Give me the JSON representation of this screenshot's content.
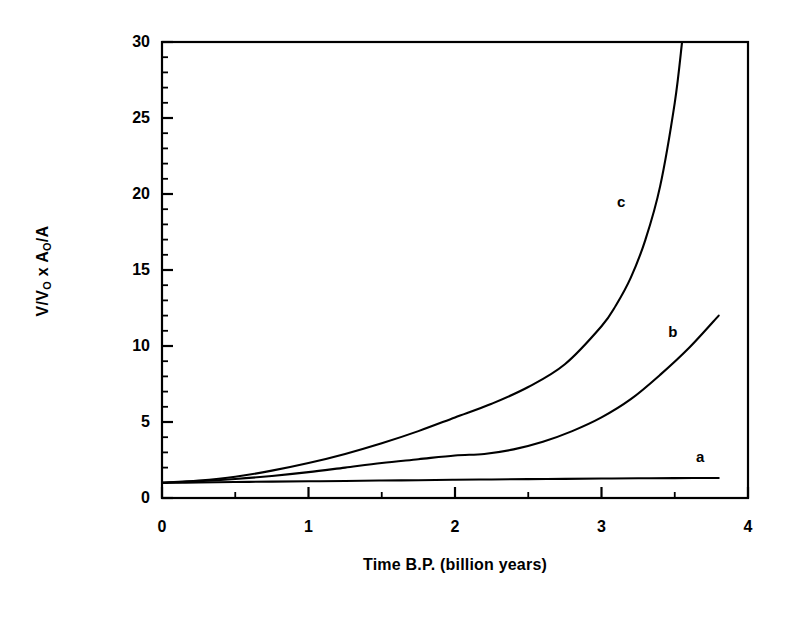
{
  "chart_data": {
    "type": "line",
    "title": "",
    "subtitle": "",
    "xlabel": "Time B.P. (billion years)",
    "ylabel": "V/V₀ x A₀/A",
    "ylabel_parts": {
      "pre1": "V/V",
      "sub1": "O",
      "mid": " x A",
      "sub2": "O",
      "post": "/A"
    },
    "xlim": [
      0,
      4
    ],
    "ylim": [
      0,
      30
    ],
    "xticks": [
      0,
      1,
      2,
      3,
      4
    ],
    "xtick_labels": [
      "0",
      "1",
      "2",
      "3",
      "4"
    ],
    "yticks": [
      0,
      5,
      10,
      15,
      20,
      25,
      30
    ],
    "ytick_labels": [
      "0",
      "5",
      "10",
      "15",
      "20",
      "25",
      "30"
    ],
    "x_minor_step": 0.5,
    "y_minor_step": 1,
    "grid": false,
    "legend": "inline curve labels",
    "line_color": "#000000",
    "background_color": "#ffffff",
    "series": [
      {
        "name": "a",
        "label": "a",
        "label_x": 3.68,
        "label_y": 2.7,
        "x": [
          0,
          0.25,
          0.5,
          0.75,
          1.0,
          1.25,
          1.5,
          1.75,
          2.0,
          2.25,
          2.5,
          2.75,
          3.0,
          3.25,
          3.5,
          3.8
        ],
        "values": [
          1.0,
          1.02,
          1.05,
          1.08,
          1.1,
          1.12,
          1.15,
          1.17,
          1.2,
          1.22,
          1.24,
          1.26,
          1.28,
          1.3,
          1.31,
          1.32
        ]
      },
      {
        "name": "b",
        "label": "b",
        "label_x": 3.49,
        "label_y": 10.9,
        "x": [
          0,
          0.25,
          0.5,
          0.75,
          1.0,
          1.25,
          1.5,
          1.75,
          2.0,
          2.2,
          2.4,
          2.6,
          2.8,
          3.0,
          3.2,
          3.4,
          3.6,
          3.8
        ],
        "values": [
          1.0,
          1.1,
          1.25,
          1.45,
          1.7,
          2.0,
          2.3,
          2.55,
          2.8,
          2.9,
          3.2,
          3.7,
          4.4,
          5.3,
          6.5,
          8.1,
          9.9,
          12.0
        ]
      },
      {
        "name": "c",
        "label": "c",
        "label_x": 3.14,
        "label_y": 19.5,
        "x": [
          0,
          0.25,
          0.5,
          0.75,
          1.0,
          1.25,
          1.5,
          1.75,
          2.0,
          2.25,
          2.5,
          2.75,
          3.0,
          3.1,
          3.2,
          3.3,
          3.4,
          3.5,
          3.55
        ],
        "values": [
          1.0,
          1.15,
          1.4,
          1.8,
          2.3,
          2.9,
          3.6,
          4.4,
          5.3,
          6.2,
          7.3,
          8.8,
          11.3,
          12.7,
          14.5,
          17.0,
          20.5,
          26.0,
          30.0
        ]
      }
    ]
  },
  "axes": {
    "x_title": "Time B.P. (billion years)",
    "y_title": "V/V₀ x A₀/A"
  }
}
